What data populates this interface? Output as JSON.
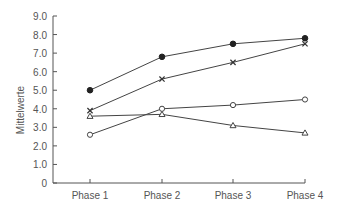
{
  "chart_data": {
    "type": "line",
    "title": "",
    "xlabel": "",
    "ylabel": "Mittelwerte",
    "categories": [
      "Phase 1",
      "Phase 2",
      "Phase 3",
      "Phase 4"
    ],
    "ylim": [
      0,
      9
    ],
    "yticks": [
      "0",
      "1.0",
      "2.0",
      "3.0",
      "4.0",
      "5.0",
      "6.0",
      "7.0",
      "8.0",
      "9.0"
    ],
    "grid": false,
    "legend": "none",
    "series": [
      {
        "name": "filled-circle",
        "marker": "filled-circle",
        "values": [
          5.0,
          6.8,
          7.5,
          7.8
        ]
      },
      {
        "name": "cross",
        "marker": "x",
        "values": [
          3.9,
          5.6,
          6.5,
          7.5
        ]
      },
      {
        "name": "open-circle",
        "marker": "open-circle",
        "values": [
          2.6,
          4.0,
          4.2,
          4.5
        ]
      },
      {
        "name": "triangle",
        "marker": "triangle",
        "values": [
          3.6,
          3.7,
          3.1,
          2.7
        ]
      }
    ]
  },
  "colors": {
    "axis": "#555555",
    "line": "#444444",
    "text": "#555555"
  }
}
